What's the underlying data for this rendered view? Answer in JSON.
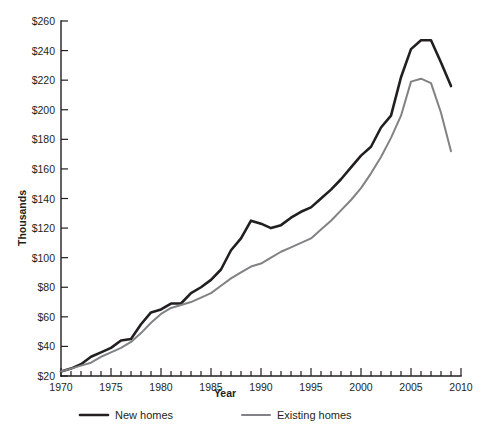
{
  "chart_data": {
    "type": "line",
    "title": "",
    "xlabel": "Year",
    "ylabel": "Thousands",
    "xlim": [
      1970,
      2010
    ],
    "ylim": [
      20,
      260
    ],
    "grid": false,
    "legend_position": "bottom",
    "x_tick_labels": [
      "1970",
      "1975",
      "1980",
      "1985",
      "1990",
      "1995",
      "2000",
      "2005",
      "2010"
    ],
    "x_tick_values": [
      1970,
      1975,
      1980,
      1985,
      1990,
      1995,
      2000,
      2005,
      2010
    ],
    "x_minor_step": 1,
    "y_tick_labels": [
      "$20",
      "$40",
      "$60",
      "$80",
      "$100",
      "$120",
      "$140",
      "$160",
      "$180",
      "$200",
      "$220",
      "$240",
      "$260"
    ],
    "y_tick_values": [
      20,
      40,
      60,
      80,
      100,
      120,
      140,
      160,
      180,
      200,
      220,
      240,
      260
    ],
    "x": [
      1970,
      1971,
      1972,
      1973,
      1974,
      1975,
      1976,
      1977,
      1978,
      1979,
      1980,
      1981,
      1982,
      1983,
      1984,
      1985,
      1986,
      1987,
      1988,
      1989,
      1990,
      1991,
      1992,
      1993,
      1994,
      1995,
      1996,
      1997,
      1998,
      1999,
      2000,
      2001,
      2002,
      2003,
      2004,
      2005,
      2006,
      2007,
      2008,
      2009
    ],
    "series": [
      {
        "name": "New homes",
        "color": "#231f20",
        "line_width": 2.6,
        "values": [
          23,
          25,
          28,
          33,
          36,
          39,
          44,
          45,
          55,
          63,
          65,
          69,
          69,
          76,
          80,
          85,
          92,
          105,
          113,
          125,
          123,
          120,
          122,
          127,
          131,
          134,
          140,
          146,
          153,
          161,
          169,
          175,
          188,
          196,
          222,
          241,
          247,
          247,
          232,
          216
        ]
      },
      {
        "name": "Existing homes",
        "color": "#808285",
        "line_width": 2.0,
        "values": [
          23,
          25,
          27,
          29,
          33,
          36,
          39,
          43,
          49,
          56,
          62,
          66,
          68,
          70,
          73,
          76,
          81,
          86,
          90,
          94,
          96,
          100,
          104,
          107,
          110,
          113,
          119,
          125,
          132,
          139,
          147,
          157,
          168,
          181,
          196,
          219,
          221,
          218,
          198,
          172
        ]
      }
    ]
  },
  "legend": {
    "items": [
      {
        "label": "New homes",
        "color": "#231f20"
      },
      {
        "label": "Existing homes",
        "color": "#808285"
      }
    ]
  }
}
